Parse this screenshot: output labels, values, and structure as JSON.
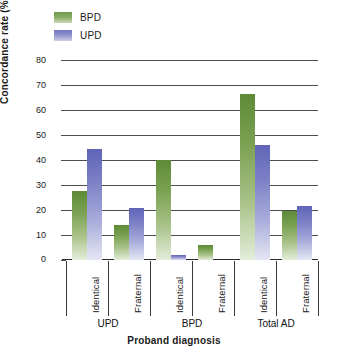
{
  "chart_data": {
    "type": "bar",
    "title": "",
    "xlabel": "Proband diagnosis",
    "ylabel": "Concordance rate (%)",
    "ylim": [
      0,
      80
    ],
    "yticks": [
      0,
      10,
      20,
      30,
      40,
      50,
      60,
      70,
      80
    ],
    "grid": true,
    "legend_position": "top-left",
    "categories": [
      "Identical",
      "Fraternal",
      "Identical",
      "Fraternal",
      "Identical",
      "Fraternal"
    ],
    "groups": [
      {
        "label": "UPD",
        "categories": [
          "Identical",
          "Fraternal"
        ]
      },
      {
        "label": "BPD",
        "categories": [
          "Identical",
          "Fraternal"
        ]
      },
      {
        "label": "Total AD",
        "categories": [
          "Identical",
          "Fraternal"
        ]
      }
    ],
    "series": [
      {
        "name": "BPD",
        "color": "#7aa152",
        "values": [
          27.5,
          14,
          40,
          6,
          66.5,
          19.5
        ]
      },
      {
        "name": "UPD",
        "color": "#7c81c6",
        "values": [
          44.5,
          21,
          2,
          0,
          46,
          21.5
        ]
      }
    ]
  },
  "legend": {
    "items": [
      {
        "label": "BPD",
        "swatch": "green-swatch"
      },
      {
        "label": "UPD",
        "swatch": "blue-swatch"
      }
    ]
  },
  "axes": {
    "y_title": "Concordance rate (%)",
    "x_title": "Proband diagnosis",
    "y_tick_labels": [
      "80",
      "70",
      "60",
      "50",
      "40",
      "30",
      "20",
      "10",
      "0"
    ],
    "x_tick_labels": [
      "Identical",
      "Fraternal",
      "Identical",
      "Fraternal",
      "Identical",
      "Fraternal"
    ],
    "group_labels": [
      "UPD",
      "BPD",
      "Total AD"
    ]
  },
  "caption": {
    "text": ""
  }
}
